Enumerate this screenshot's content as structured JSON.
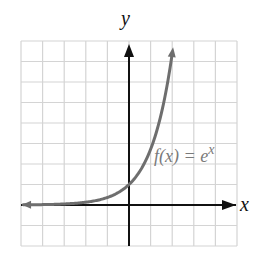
{
  "chart_data": {
    "type": "line",
    "title": "",
    "xlabel": "x",
    "ylabel": "y",
    "xlim": [
      -5,
      5
    ],
    "ylim": [
      -2,
      8
    ],
    "grid": true,
    "legend": null,
    "ticks": {
      "x": [],
      "y": []
    },
    "series": [
      {
        "name": "f(x) = e^x",
        "function": "e^x",
        "x": [
          -5,
          -4,
          -3,
          -2,
          -1,
          0,
          1,
          1.5,
          2,
          2.05
        ],
        "y": [
          0.007,
          0.018,
          0.05,
          0.135,
          0.368,
          1,
          2.718,
          4.482,
          7.389,
          7.77
        ]
      }
    ],
    "annotations": [
      {
        "text": "f(x) = e^x",
        "x": 1.3,
        "y": 2.9
      }
    ]
  },
  "labels": {
    "x_axis": "x",
    "y_axis": "y",
    "func_name": "f(x) = e",
    "func_exp": "x"
  },
  "colors": {
    "grid": "#d4d4d4",
    "axis": "#111111",
    "curve": "#6e6e6e",
    "label": "#7a7a7a"
  }
}
